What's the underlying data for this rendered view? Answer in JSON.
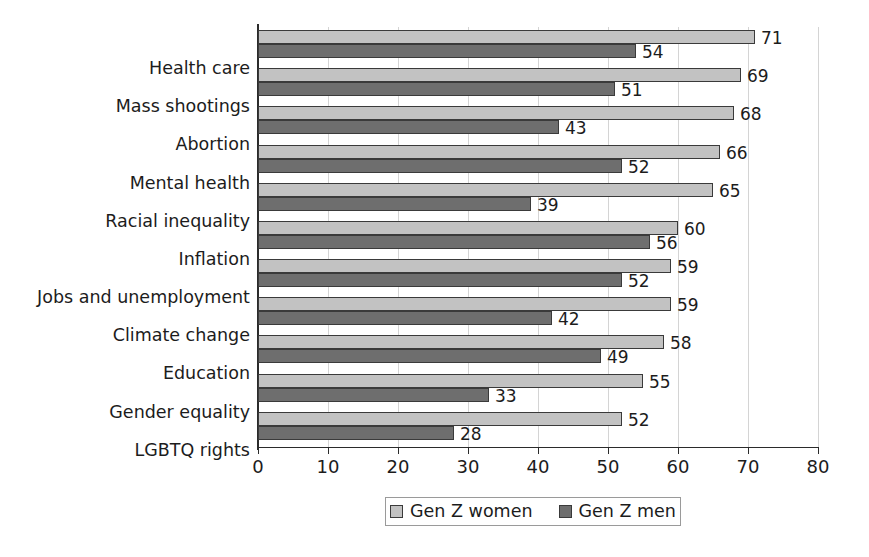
{
  "chart_data": {
    "type": "bar",
    "orientation": "horizontal",
    "title": "",
    "subtitle": "",
    "xlabel": "",
    "ylabel": "",
    "xlim": [
      0,
      80
    ],
    "xticks": [
      "0",
      "10",
      "20",
      "30",
      "40",
      "50",
      "60",
      "70",
      "80"
    ],
    "xtick_values": [
      0,
      10,
      20,
      30,
      40,
      50,
      60,
      70,
      80
    ],
    "grid": true,
    "grid_axis": "x",
    "legend_position": "bottom",
    "categories": [
      "Health care",
      "Mass shootings",
      "Abortion",
      "Mental health",
      "Racial inequality",
      "Inflation",
      "Jobs and unemployment",
      "Climate change",
      "Education",
      "Gender equality",
      "LGBTQ rights"
    ],
    "series": [
      {
        "name": "Gen Z women",
        "color": "#c2c2c2",
        "values": [
          71,
          69,
          68,
          66,
          65,
          60,
          59,
          59,
          58,
          55,
          52
        ]
      },
      {
        "name": "Gen Z men",
        "color": "#6e6e6e",
        "values": [
          54,
          51,
          43,
          52,
          39,
          56,
          52,
          42,
          49,
          33,
          28
        ]
      }
    ]
  },
  "legend": {
    "items": [
      {
        "label": "Gen Z women",
        "color": "#c2c2c2"
      },
      {
        "label": "Gen Z men",
        "color": "#6e6e6e"
      }
    ]
  },
  "colors": {
    "women_bar": "#c2c2c2",
    "men_bar": "#6e6e6e",
    "bar_border": "#3a3a3a",
    "axis": "#2b2b2b",
    "gridline": "#d4d4d4",
    "background": "#ffffff",
    "text": "#1c1c1c"
  }
}
